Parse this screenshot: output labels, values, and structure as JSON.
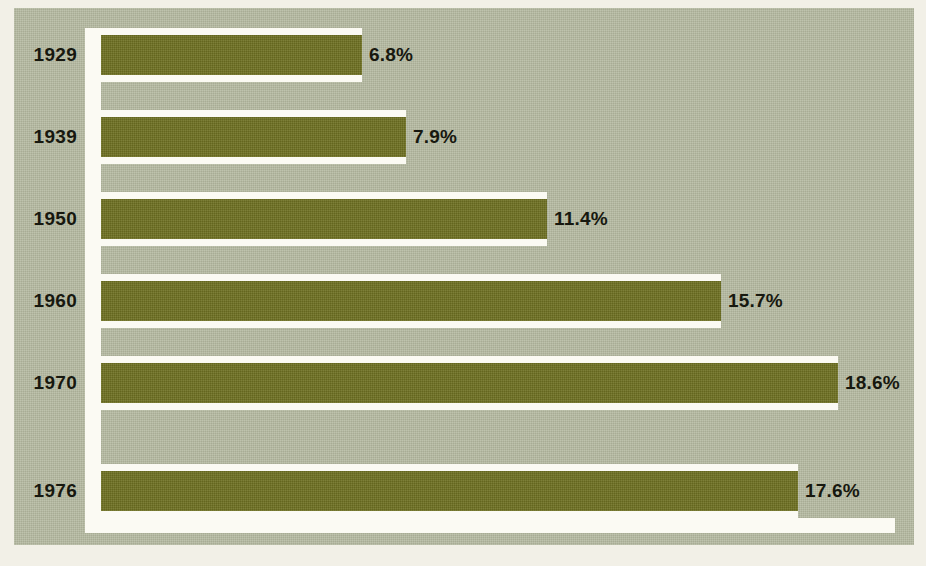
{
  "chart_data": {
    "type": "bar",
    "orientation": "horizontal",
    "title": "",
    "subtitle": "",
    "xlabel": "",
    "ylabel": "",
    "categories": [
      "1929",
      "1939",
      "1950",
      "1960",
      "1970",
      "1976"
    ],
    "values": [
      6.8,
      7.9,
      11.4,
      15.7,
      18.6,
      17.6
    ],
    "value_labels": [
      "6.8%",
      "7.9%",
      "11.4%",
      "15.7%",
      "18.6%",
      "17.6%"
    ],
    "unit": "%",
    "xlim": [
      0,
      18.6
    ],
    "grid": false,
    "legend": null,
    "series": [
      {
        "name": "",
        "values": [
          6.8,
          7.9,
          11.4,
          15.7,
          18.6,
          17.6
        ]
      }
    ]
  },
  "style": {
    "panel_background": "#b4b9a0",
    "page_background": "#f2f0e7",
    "bar_color": "#6f7122",
    "track_color": "#fbfaf3",
    "text_color": "#17180f"
  },
  "rows": [
    {
      "year": "1929",
      "value": 6.8,
      "value_label": "6.8%",
      "top": 20,
      "bar_px": 261,
      "track_px": 277
    },
    {
      "year": "1939",
      "value": 7.9,
      "value_label": "7.9%",
      "top": 102,
      "bar_px": 305,
      "track_px": 321
    },
    {
      "year": "1950",
      "value": 11.4,
      "value_label": "11.4%",
      "top": 184,
      "bar_px": 446,
      "track_px": 462
    },
    {
      "year": "1960",
      "value": 15.7,
      "value_label": "15.7%",
      "top": 266,
      "bar_px": 620,
      "track_px": 636
    },
    {
      "year": "1970",
      "value": 18.6,
      "value_label": "18.6%",
      "top": 348,
      "bar_px": 737,
      "track_px": 753
    },
    {
      "year": "1976",
      "value": 17.6,
      "value_label": "17.6%",
      "top": 456,
      "bar_px": 697,
      "track_px": 713
    }
  ]
}
